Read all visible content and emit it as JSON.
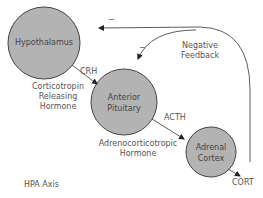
{
  "diagram": {
    "title": "HPA Axis",
    "nodes": [
      {
        "id": "hypothalamus",
        "label": "Hypothalamus",
        "fill": "#b3b3b3"
      },
      {
        "id": "anterior_pituitary",
        "label_line1": "Anterior",
        "label_line2": "Pituitary",
        "fill": "#b3b3b3"
      },
      {
        "id": "adrenal_cortex",
        "label_line1": "Adrenal",
        "label_line2": "Cortex",
        "fill": "#b3b3b3"
      }
    ],
    "edges": [
      {
        "from": "hypothalamus",
        "to": "anterior_pituitary",
        "label": "CRH",
        "description_line1": "Corticotropin",
        "description_line2": "Releasing",
        "description_line3": "Hormone"
      },
      {
        "from": "anterior_pituitary",
        "to": "adrenal_cortex",
        "label": "ACTH",
        "description_line1": "Adrenocorticotropic",
        "description_line2": "Hormone"
      },
      {
        "from": "adrenal_cortex",
        "to": "output",
        "label": "CORT"
      }
    ],
    "feedback": {
      "label_line1": "Negative",
      "label_line2": "Feedback",
      "sign_to_hypothalamus": "−",
      "sign_to_pituitary": "−"
    }
  }
}
